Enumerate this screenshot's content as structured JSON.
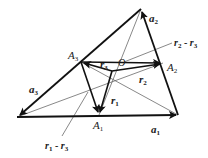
{
  "diagram": {
    "type": "vector-triangle",
    "colors": {
      "stroke": "#111111",
      "thin": "#555555",
      "text": "#222222",
      "background": "#ffffff"
    },
    "points": {
      "L": [
        17,
        117
      ],
      "R": [
        178,
        115
      ],
      "T": [
        141,
        9
      ],
      "A1": [
        99,
        115
      ],
      "A2": [
        163,
        63
      ],
      "A3": [
        81,
        62
      ],
      "O": [
        112,
        71
      ]
    },
    "labels": {
      "A3": {
        "base": "A",
        "sub": "3"
      },
      "A2": {
        "base": "A",
        "sub": "2"
      },
      "A1": {
        "base": "A",
        "sub": "1"
      },
      "O": {
        "base": "O",
        "sub": ""
      },
      "a1": {
        "base": "a",
        "sub": "1"
      },
      "a2": {
        "base": "a",
        "sub": "2"
      },
      "a3": {
        "base": "a",
        "sub": "3"
      },
      "r1": {
        "base": "r",
        "sub": "1"
      },
      "r2": {
        "base": "r",
        "sub": "2"
      },
      "r3": {
        "base": "r",
        "sub": "3"
      },
      "r2_minus_r3": {
        "t1": "r",
        "s1": "2",
        "op": " - ",
        "t2": "r",
        "s2": "3"
      },
      "r1_minus_r3": {
        "t1": "r",
        "s1": "1",
        "op": " - ",
        "t2": "r",
        "s2": "3"
      }
    }
  }
}
